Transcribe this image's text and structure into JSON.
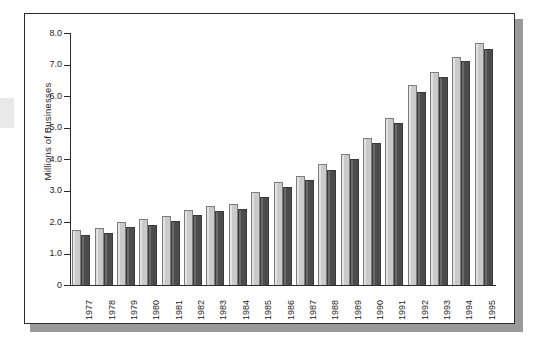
{
  "chart_data": {
    "type": "bar",
    "title": "",
    "subtitle": "",
    "xlabel": "",
    "ylabel": "Millions of Businesses",
    "ylim": [
      0,
      8.0
    ],
    "ytick_labels": [
      "8.0",
      "7.0",
      "6.0",
      "5.0",
      "4.0",
      "3.0",
      "2.0",
      "1.0",
      "0"
    ],
    "ytick_values": [
      8.0,
      7.0,
      6.0,
      5.0,
      4.0,
      3.0,
      2.0,
      1.0,
      0
    ],
    "grid": false,
    "legend": "none",
    "categories": [
      "1977",
      "1978",
      "1979",
      "1980",
      "1981",
      "1982",
      "1983",
      "1984",
      "1985",
      "1986",
      "1987",
      "1988",
      "1989",
      "1990",
      "1991",
      "1992",
      "1993",
      "1994",
      "1995"
    ],
    "series": [
      {
        "name": "Series 1",
        "color": "#cacaca",
        "values": [
          1.74,
          1.8,
          2.0,
          2.08,
          2.18,
          2.38,
          2.5,
          2.57,
          2.96,
          3.28,
          3.47,
          3.83,
          4.16,
          4.66,
          5.3,
          6.34,
          6.77,
          7.25,
          7.67
        ]
      },
      {
        "name": "Series 2",
        "color": "#4c4c4c",
        "values": [
          1.59,
          1.65,
          1.84,
          1.92,
          2.03,
          2.23,
          2.34,
          2.41,
          2.81,
          3.11,
          3.32,
          3.66,
          4.0,
          4.5,
          5.14,
          6.14,
          6.6,
          7.1,
          7.49
        ]
      }
    ]
  }
}
